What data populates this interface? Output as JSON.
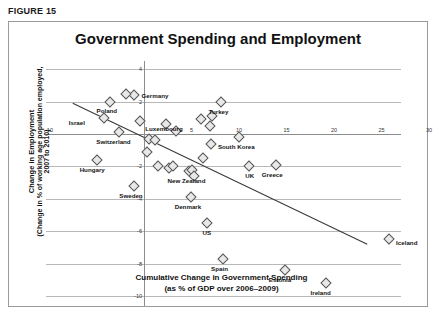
{
  "figure": {
    "label": "FIGURE 15",
    "title": "Government Spending and Employment"
  },
  "chart_data": {
    "type": "scatter",
    "title": "Government Spending and Employment",
    "xlabel_line1": "Cumulative Change in Government Spending",
    "xlabel_line2": "(as % of GDP over 2006–2009)",
    "ylabel_line1": "Change in Employment",
    "ylabel_line2": "(Change in % of working age population employed,",
    "ylabel_line3": "2007 to 2010)",
    "xlim": [
      -12,
      31
    ],
    "ylim": [
      -10.8,
      4.6
    ],
    "xticks": [
      -10,
      5,
      10,
      15,
      20,
      25,
      30
    ],
    "yticks": [
      4,
      2,
      -2,
      -4,
      -6,
      -8,
      -10
    ],
    "grid": "horizontal",
    "legend": "none",
    "trendline": {
      "visible": true,
      "x_start": -7.5,
      "y_start": 1.9,
      "x_end": 23.5,
      "y_end": -6.8
    },
    "points": [
      {
        "label": "Germany",
        "x": -1.1,
        "y": 2.4,
        "label_dx": 8,
        "label_dy": 0
      },
      {
        "label": "",
        "x": -1.9,
        "y": 2.5,
        "label_dx": 0,
        "label_dy": 0
      },
      {
        "label": "Poland",
        "x": -3.6,
        "y": 2.0,
        "label_dx": -4,
        "label_dy": 8
      },
      {
        "label": "Israel",
        "x": -4.2,
        "y": 1.0,
        "label_dx": -26,
        "label_dy": 4
      },
      {
        "label": "Luxembourg",
        "x": -0.4,
        "y": 0.8,
        "label_dx": 5,
        "label_dy": 7
      },
      {
        "label": "Switzerland",
        "x": -2.6,
        "y": 0.1,
        "label_dx": -6,
        "label_dy": 9
      },
      {
        "label": "Hungary",
        "x": -5.0,
        "y": -1.6,
        "label_dx": -6,
        "label_dy": 9
      },
      {
        "label": "Sweden",
        "x": -1.1,
        "y": -3.2,
        "label_dx": -5,
        "label_dy": 9
      },
      {
        "label": "",
        "x": 0.5,
        "y": -0.3,
        "label_dx": 0,
        "label_dy": 0
      },
      {
        "label": "",
        "x": 0.3,
        "y": -1.1,
        "label_dx": 0,
        "label_dy": 0
      },
      {
        "label": "",
        "x": 1.2,
        "y": -0.4,
        "label_dx": 0,
        "label_dy": 0
      },
      {
        "label": "",
        "x": 2.3,
        "y": 0.6,
        "label_dx": 0,
        "label_dy": 0
      },
      {
        "label": "",
        "x": 3.4,
        "y": 0.2,
        "label_dx": 0,
        "label_dy": 0
      },
      {
        "label": "",
        "x": 1.5,
        "y": -2.0,
        "label_dx": 0,
        "label_dy": 0
      },
      {
        "label": "",
        "x": 2.6,
        "y": -2.1,
        "label_dx": 0,
        "label_dy": 0
      },
      {
        "label": "",
        "x": 3.1,
        "y": -2.0,
        "label_dx": 0,
        "label_dy": 0
      },
      {
        "label": "",
        "x": 6.0,
        "y": 0.9,
        "label_dx": 0,
        "label_dy": 0
      },
      {
        "label": "",
        "x": 6.9,
        "y": 0.5,
        "label_dx": 0,
        "label_dy": 0
      },
      {
        "label": "",
        "x": 7.2,
        "y": 1.1,
        "label_dx": 0,
        "label_dy": 0
      },
      {
        "label": "",
        "x": 7.0,
        "y": -0.6,
        "label_dx": 0,
        "label_dy": 0
      },
      {
        "label": "",
        "x": 6.2,
        "y": -1.5,
        "label_dx": 0,
        "label_dy": 0
      },
      {
        "label": "New Zealand",
        "x": 4.7,
        "y": -2.3,
        "label_dx": -4,
        "label_dy": 9
      },
      {
        "label": "",
        "x": 5.1,
        "y": -2.2,
        "label_dx": 0,
        "label_dy": 0
      },
      {
        "label": "",
        "x": 5.3,
        "y": -2.6,
        "label_dx": 0,
        "label_dy": 0
      },
      {
        "label": "Turkey",
        "x": 8.1,
        "y": 2.0,
        "label_dx": -3,
        "label_dy": 9
      },
      {
        "label": "South Korea",
        "x": 10.0,
        "y": -0.2,
        "label_dx": -4,
        "label_dy": 9
      },
      {
        "label": "UK",
        "x": 11.1,
        "y": -2.0,
        "label_dx": -1,
        "label_dy": 9
      },
      {
        "label": "Greece",
        "x": 13.9,
        "y": -1.9,
        "label_dx": -5,
        "label_dy": 9
      },
      {
        "label": "Denmark",
        "x": 4.9,
        "y": -3.9,
        "label_dx": -5,
        "label_dy": 9
      },
      {
        "label": "US",
        "x": 6.6,
        "y": -5.5,
        "label_dx": -1,
        "label_dy": 9
      },
      {
        "label": "Spain",
        "x": 8.3,
        "y": -7.7,
        "label_dx": -4,
        "label_dy": 9
      },
      {
        "label": "Estonia",
        "x": 14.8,
        "y": -8.4,
        "label_dx": -5,
        "label_dy": 9
      },
      {
        "label": "Ireland",
        "x": 19.2,
        "y": -9.2,
        "label_dx": -5,
        "label_dy": 9
      },
      {
        "label": "Iceland",
        "x": 25.8,
        "y": -6.5,
        "label_dx": 7,
        "label_dy": 3
      }
    ]
  }
}
